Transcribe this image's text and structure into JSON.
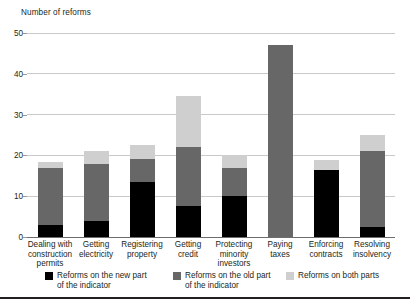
{
  "chart_data": {
    "type": "bar",
    "title": "Number of reforms",
    "xlabel": "",
    "ylabel": "Number of reforms",
    "stacked": true,
    "grid": true,
    "legend_position": "bottom",
    "ylim": [
      0,
      50
    ],
    "yticks": [
      0,
      10,
      20,
      30,
      40,
      50
    ],
    "ytick_labels": [
      "0",
      "10",
      "20",
      "30",
      "40",
      "50"
    ],
    "categories": [
      "Dealing with\nconstruction\npermits",
      "Getting\nelectricity",
      "Registering\nproperty",
      "Getting\ncredit",
      "Protecting\nminority\ninvestors",
      "Paying\ntaxes",
      "Enforcing\ncontracts",
      "Resolving\ninsolvency"
    ],
    "series": [
      {
        "name": "Reforms on the new part\nof the indicator",
        "color": "#000000",
        "values": [
          3,
          4,
          13.5,
          7.5,
          10,
          0,
          16.5,
          2.5
        ]
      },
      {
        "name": "Reforms on the old part\nof the indicator",
        "color": "#676767",
        "values": [
          14,
          14,
          5.5,
          14.5,
          7,
          47,
          0,
          18.5
        ]
      },
      {
        "name": "Reforms on both parts",
        "color": "#cfcfcf",
        "values": [
          1.5,
          3,
          3.5,
          12.5,
          3,
          0,
          2.5,
          4
        ]
      }
    ],
    "totals": [
      18.5,
      21,
      22.5,
      34.5,
      20,
      47,
      19,
      25
    ]
  },
  "legend": {
    "items": [
      {
        "label": "Reforms on the new part\nof the indicator",
        "color": "#000000"
      },
      {
        "label": "Reforms on the old part\nof the indicator",
        "color": "#676767"
      },
      {
        "label": "Reforms on both parts",
        "color": "#cfcfcf"
      }
    ]
  }
}
